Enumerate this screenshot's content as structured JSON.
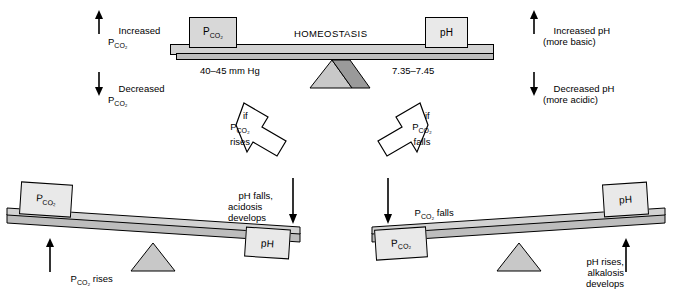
{
  "top": {
    "center_label": "HOMEOSTASIS",
    "left_block": "P",
    "left_block_sub": "CO₂",
    "right_block": "pH",
    "left_value": "40–45 mm Hg",
    "right_value": "7.35–7.45",
    "left_up": "Increased",
    "left_up_sub": "P",
    "left_up_sub2": "CO₂",
    "left_down": "Decreased",
    "left_down_sub": "P",
    "left_down_sub2": "CO₂",
    "right_up_line1": "Increased pH",
    "right_up_line2": "(more basic)",
    "right_down_line1": "Decreased pH",
    "right_down_line2": "(more acidic)"
  },
  "arrows": {
    "left_if": "if",
    "left_line2": "P",
    "left_line2_sub": "CO₂",
    "left_line3": "rises",
    "right_if": "if",
    "right_line2": "P",
    "right_line2_sub": "CO₂",
    "right_line3": "falls"
  },
  "bottom_left": {
    "block_left": "P",
    "block_left_sub": "CO₂",
    "block_right": "pH",
    "arrow_up_label": "P",
    "arrow_up_label_sub": "CO₂",
    "arrow_up_label_rest": " rises",
    "arrow_down_line1": "pH falls,",
    "arrow_down_line2": "acidosis",
    "arrow_down_line3": "develops"
  },
  "bottom_right": {
    "block_left": "P",
    "block_left_sub": "CO₂",
    "block_right": "pH",
    "arrow_down_label": "P",
    "arrow_down_label_sub": "CO₂",
    "arrow_down_label_rest": " falls",
    "arrow_up_line1": "pH rises,",
    "arrow_up_line2": "alkalosis",
    "arrow_up_line3": "develops"
  },
  "colors": {
    "beam_top": "#d2d2d2",
    "beam_edge": "#bdbdbd",
    "block_fill": "#e9e9e9",
    "fulcrum_light": "#c8c8c8",
    "fulcrum_dark": "#9a9a9a",
    "outline": "#000000"
  }
}
